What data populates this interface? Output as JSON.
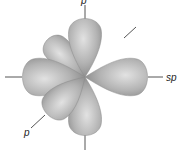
{
  "diagram": {
    "type": "orbital-lobes",
    "labels": {
      "top": "p",
      "right": "sp",
      "lower_left": "p"
    },
    "colors": {
      "lobe_light": "#d6d6d6",
      "lobe_mid": "#a8a8a8",
      "lobe_dark": "#7a7a7a",
      "axis": "#555555",
      "background": "#ffffff"
    }
  }
}
